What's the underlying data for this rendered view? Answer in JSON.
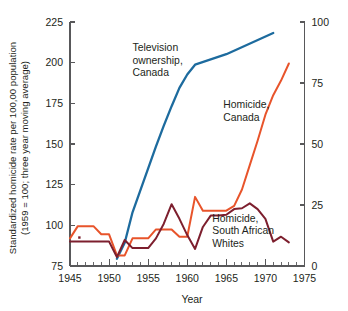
{
  "chart_data": {
    "type": "line",
    "title": "",
    "xlabel": "Year",
    "ylabel_line1": "Standardized homicide rate per 100,00 population",
    "ylabel_line2": "(1959 = 100; three year moving average)",
    "ylabel_right": "",
    "xlim": [
      1945,
      1975
    ],
    "ylim": [
      75,
      225
    ],
    "ylim_right": [
      0,
      100
    ],
    "xticks": [
      1945,
      1950,
      1955,
      1960,
      1965,
      1970,
      1975
    ],
    "xticklabels": [
      "1945",
      "1950",
      "1955",
      "1960",
      "1965",
      "1970",
      "1975"
    ],
    "xminor_step": 1,
    "yticks": [
      75,
      100,
      125,
      150,
      175,
      200,
      225
    ],
    "yticklabels": [
      "75",
      "100",
      "125",
      "150",
      "175",
      "200",
      "225"
    ],
    "yticks_right": [
      0,
      25,
      50,
      75,
      100
    ],
    "yticklabels_right": [
      "0",
      "25",
      "50",
      "75",
      "100"
    ],
    "grid": false,
    "legend_position": "inline-annotations",
    "series": [
      {
        "name": "Television ownership, Canada",
        "axis": "right",
        "color": "#1d6b9e",
        "stroke_width": 2.3,
        "annotation": "Television\nownership,\nCanada",
        "annotation_x": 1953.0,
        "annotation_y_left": 207.0,
        "points": [
          {
            "x": 1951.0,
            "y": 3.0
          },
          {
            "x": 1952.0,
            "y": 9.5
          },
          {
            "x": 1953.0,
            "y": 22.0
          },
          {
            "x": 1954.0,
            "y": 31.0
          },
          {
            "x": 1955.0,
            "y": 40.0
          },
          {
            "x": 1956.0,
            "y": 49.0
          },
          {
            "x": 1957.0,
            "y": 57.5
          },
          {
            "x": 1958.0,
            "y": 65.5
          },
          {
            "x": 1959.0,
            "y": 73.0
          },
          {
            "x": 1960.0,
            "y": 78.5
          },
          {
            "x": 1961.0,
            "y": 82.5
          },
          {
            "x": 1965.0,
            "y": 86.8
          },
          {
            "x": 1971.0,
            "y": 95.5
          }
        ]
      },
      {
        "name": "Homicide, Canada",
        "axis": "left",
        "color": "#e8542b",
        "stroke_width": 2.0,
        "annotation": "Homicide,\nCanada",
        "annotation_x": 1964.6,
        "annotation_y_left": 172.0,
        "points": [
          {
            "x": 1945.0,
            "y": 92.0
          },
          {
            "x": 1946.0,
            "y": 99.5
          },
          {
            "x": 1947.0,
            "y": 99.5
          },
          {
            "x": 1948.0,
            "y": 99.5
          },
          {
            "x": 1949.0,
            "y": 94.5
          },
          {
            "x": 1950.0,
            "y": 94.5
          },
          {
            "x": 1951.0,
            "y": 81.5
          },
          {
            "x": 1952.0,
            "y": 81.5
          },
          {
            "x": 1953.0,
            "y": 92.0
          },
          {
            "x": 1954.0,
            "y": 92.0
          },
          {
            "x": 1955.0,
            "y": 92.0
          },
          {
            "x": 1956.0,
            "y": 97.5
          },
          {
            "x": 1957.0,
            "y": 97.5
          },
          {
            "x": 1958.0,
            "y": 97.5
          },
          {
            "x": 1959.0,
            "y": 93.0
          },
          {
            "x": 1960.0,
            "y": 93.0
          },
          {
            "x": 1961.0,
            "y": 117.5
          },
          {
            "x": 1962.0,
            "y": 109.0
          },
          {
            "x": 1963.0,
            "y": 109.0
          },
          {
            "x": 1964.0,
            "y": 109.0
          },
          {
            "x": 1965.0,
            "y": 109.0
          },
          {
            "x": 1966.0,
            "y": 112.0
          },
          {
            "x": 1967.0,
            "y": 122.0
          },
          {
            "x": 1968.0,
            "y": 137.0
          },
          {
            "x": 1969.0,
            "y": 152.0
          },
          {
            "x": 1970.0,
            "y": 168.0
          },
          {
            "x": 1971.0,
            "y": 180.0
          },
          {
            "x": 1972.0,
            "y": 189.0
          },
          {
            "x": 1973.0,
            "y": 199.5
          }
        ]
      },
      {
        "name": "Homicide, South African Whites",
        "axis": "left",
        "color": "#7d1f2e",
        "stroke_width": 2.0,
        "annotation": "Homicide,\nSouth African\nWhites",
        "annotation_x": 1963.2,
        "annotation_y_left": 102.0,
        "marker_point": {
          "x": 1946.2,
          "y": 92.5
        },
        "points": [
          {
            "x": 1945.0,
            "y": 90.0
          },
          {
            "x": 1946.0,
            "y": 90.0
          },
          {
            "x": 1947.0,
            "y": 90.0
          },
          {
            "x": 1948.0,
            "y": 90.0
          },
          {
            "x": 1949.0,
            "y": 90.0
          },
          {
            "x": 1950.0,
            "y": 90.0
          },
          {
            "x": 1951.0,
            "y": 80.5
          },
          {
            "x": 1952.0,
            "y": 91.0
          },
          {
            "x": 1953.0,
            "y": 86.0
          },
          {
            "x": 1954.0,
            "y": 86.0
          },
          {
            "x": 1955.0,
            "y": 86.0
          },
          {
            "x": 1956.0,
            "y": 92.0
          },
          {
            "x": 1957.0,
            "y": 101.0
          },
          {
            "x": 1958.0,
            "y": 113.0
          },
          {
            "x": 1959.0,
            "y": 104.0
          },
          {
            "x": 1960.0,
            "y": 94.0
          },
          {
            "x": 1961.0,
            "y": 85.5
          },
          {
            "x": 1962.0,
            "y": 99.0
          },
          {
            "x": 1963.0,
            "y": 106.0
          },
          {
            "x": 1964.0,
            "y": 106.0
          },
          {
            "x": 1965.0,
            "y": 106.5
          },
          {
            "x": 1966.0,
            "y": 110.0
          },
          {
            "x": 1967.0,
            "y": 110.5
          },
          {
            "x": 1968.0,
            "y": 113.5
          },
          {
            "x": 1969.0,
            "y": 110.0
          },
          {
            "x": 1970.0,
            "y": 104.0
          },
          {
            "x": 1971.0,
            "y": 90.0
          },
          {
            "x": 1972.0,
            "y": 93.0
          },
          {
            "x": 1973.0,
            "y": 89.5
          }
        ]
      }
    ]
  }
}
